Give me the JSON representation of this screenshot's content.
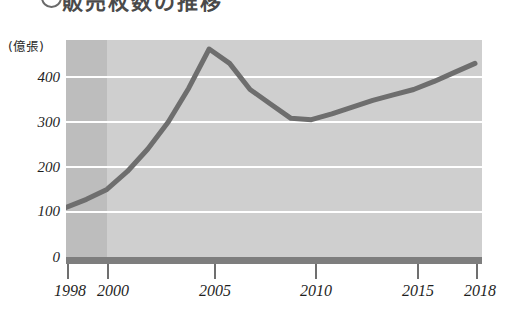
{
  "heading": {
    "marker": "circle-marker",
    "text": "販売枚数の推移"
  },
  "chart_data": {
    "type": "line",
    "title": "",
    "subtitle": "",
    "xlabel": "",
    "ylabel": "(億張)",
    "unit_label": "(億張)",
    "x": [
      1998,
      1999,
      2000,
      2001,
      2002,
      2003,
      2004,
      2005,
      2006,
      2007,
      2008,
      2009,
      2010,
      2011,
      2012,
      2013,
      2014,
      2015,
      2016,
      2017,
      2018
    ],
    "values": [
      110,
      128,
      150,
      190,
      240,
      300,
      375,
      462,
      430,
      372,
      340,
      308,
      305,
      318,
      333,
      348,
      360,
      372,
      390,
      410,
      430
    ],
    "series": [
      {
        "name": "販売枚数",
        "color": "#6e6e6e",
        "values": [
          110,
          128,
          150,
          190,
          240,
          300,
          375,
          462,
          430,
          372,
          340,
          308,
          305,
          318,
          333,
          348,
          360,
          372,
          390,
          410,
          430
        ]
      }
    ],
    "xticks": [
      1998,
      2000,
      2005,
      2010,
      2015,
      2018
    ],
    "xtick_labels": [
      "1998",
      "2000",
      "2005",
      "2010",
      "2015",
      "2018"
    ],
    "yticks": [
      0,
      100,
      200,
      300,
      400
    ],
    "ytick_labels": [
      "0",
      "100",
      "200",
      "300",
      "400"
    ],
    "ylim": [
      0,
      482
    ],
    "xlim": [
      1998,
      2018
    ],
    "grid": true,
    "grid_color": "#ffffff",
    "legend": null,
    "plot_bg": "#cfcfcf",
    "shaded_band": {
      "name": "1998-2000-early-band",
      "from": 1998,
      "to": 2000,
      "color": "#bdbdbd"
    },
    "axis_bar_color": "#7e7e7e",
    "line_color": "#6e6e6e"
  }
}
